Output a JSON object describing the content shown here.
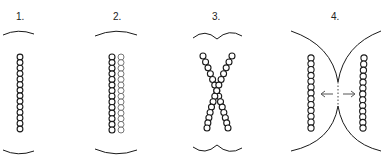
{
  "figure": {
    "colors": {
      "background": "#ffffff",
      "stroke": "#1a1a1a",
      "bead_fill": "#ffffff",
      "light_bead_stroke": "#777777",
      "arrow": "#555555"
    },
    "panels": [
      {
        "label": "1.",
        "description": "single bead chain between two separated membranes"
      },
      {
        "label": "2.",
        "description": "two adjacent bead chains between two separated membranes"
      },
      {
        "label": "3.",
        "description": "crossing bead chains with membranes dimpling inward"
      },
      {
        "label": "4.",
        "description": "membranes fused at center, chains pushed apart with arrows"
      }
    ],
    "arrows": {
      "left": "←",
      "right": "→"
    }
  }
}
